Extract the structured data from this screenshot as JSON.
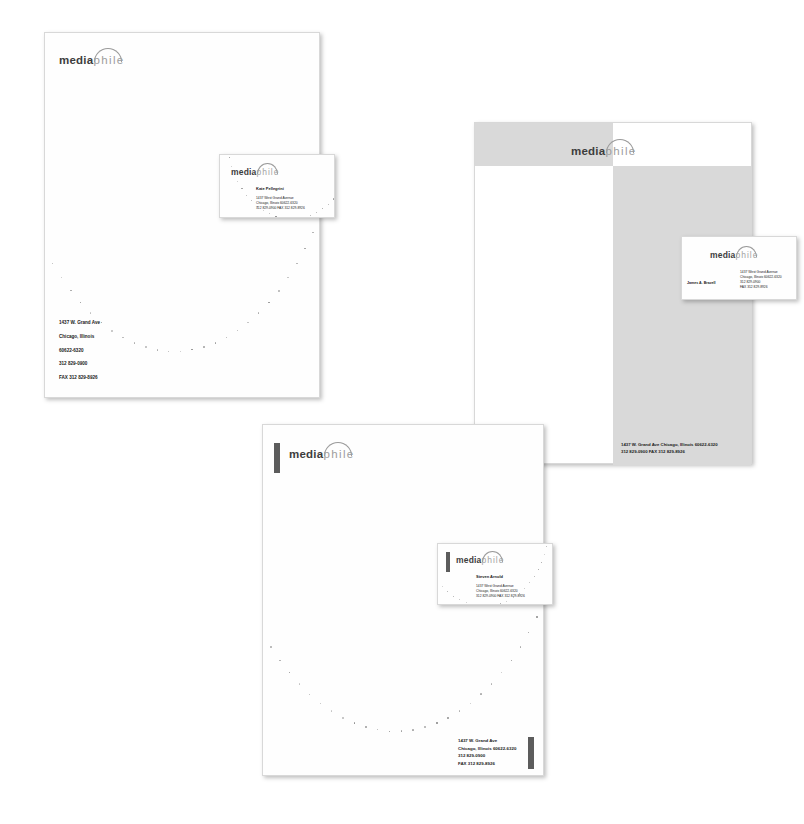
{
  "brand": {
    "name_bold": "media",
    "name_light": "phile",
    "logo_arc": "arc-over-ia",
    "ink_dark": "#3d3d3d",
    "ink_light": "#9d9d9d",
    "panel_gray": "#d9d9d9",
    "bar_gray": "#5c5c5c"
  },
  "letterhead_1": {
    "label": "letterhead-white-left-aligned",
    "address_lines": [
      "1437 W. Grand Ave",
      "Chicago, Illinois",
      "60622-6320",
      "312 829-0900",
      "FAX 312 829-8926"
    ]
  },
  "business_card_1": {
    "label": "business-card-centered",
    "person_name": "Kate Pellegrini",
    "address_lines": [
      "1437 West Grand Avenue",
      "Chicago, Illinois 60622-6320",
      "312 829-0900     FAX 312 829-8926"
    ]
  },
  "letterhead_2": {
    "label": "letterhead-gray-checkerboard",
    "address_lines": [
      "1437 W. Grand Ave     Chicago, Illinois 60622-6320",
      "312 829-0900     FAX 312 829-8926"
    ]
  },
  "business_card_2": {
    "label": "business-card-split-gray",
    "person_name": "James A. Brazell",
    "address_lines": [
      "1437 West Grand Avenue",
      "Chicago, Illinois 60622-6320",
      "312 829-0900",
      "FAX 312 829-8926"
    ]
  },
  "letterhead_3": {
    "label": "letterhead-with-rule-bars",
    "address_lines": [
      "1437 W. Grand Ave",
      "Chicago, Illinois 60622-6320",
      "312 829-0900",
      "FAX 312 829-8926"
    ]
  },
  "business_card_3": {
    "label": "business-card-bar-left",
    "person_name": "Steven Arnold",
    "address_lines": [
      "1437 West Grand Avenue",
      "Chicago, Illinois 60622-6320",
      "312 829-0900     FAX 312 829-8926"
    ]
  }
}
